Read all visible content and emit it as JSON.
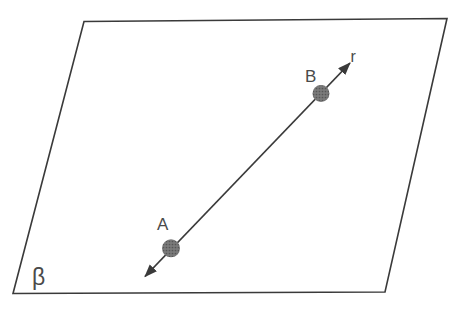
{
  "figure": {
    "width": 453,
    "height": 313,
    "background_color": "#ffffff",
    "stroke_color": "#3a3a3a",
    "label_color": "#4a4a4a",
    "point_base_color": "#7a7a7a",
    "point_dot_color": "#565656",
    "plane": {
      "label": "β",
      "corners": "84,21.5 447,18.5 385,292 13,293.5",
      "stroke_width": 1.6,
      "label_x": 32,
      "label_y": 285,
      "label_font_size": 23
    },
    "line": {
      "label": "r",
      "x1": 145,
      "y1": 276.5,
      "x2": 350,
      "y2": 63,
      "stroke_width": 1.8,
      "label_x": 350.5,
      "label_y": 62,
      "label_font_size": 16
    },
    "points": [
      {
        "label": "A",
        "cx": 171,
        "cy": 248.3,
        "r": 9,
        "label_x": 157,
        "label_y": 230,
        "label_font_size": 17
      },
      {
        "label": "B",
        "cx": 321,
        "cy": 93.5,
        "r": 8.5,
        "label_x": 305,
        "label_y": 82,
        "label_font_size": 17
      }
    ]
  }
}
